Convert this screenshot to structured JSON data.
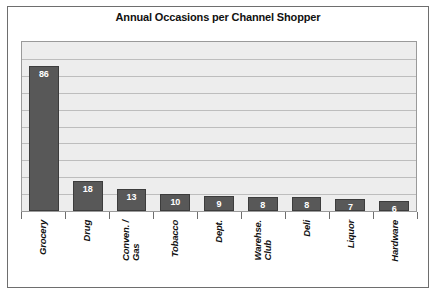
{
  "chart_data": {
    "type": "bar",
    "title": "Annual Occasions per Channel Shopper",
    "xlabel": "",
    "ylabel": "",
    "ylim": [
      0,
      100
    ],
    "grid": true,
    "gridline_count": 9,
    "legend": "none",
    "orientation": "vertical",
    "category_label_rotation": -90,
    "value_labels_inside_bars": true,
    "categories": [
      "Grocery",
      "Drug",
      "Conven. / Gas",
      "Tobacco",
      "Dept.",
      "Warehse. Club",
      "Deli",
      "Liquor",
      "Hardware"
    ],
    "category_lines": [
      [
        "Grocery"
      ],
      [
        "Drug"
      ],
      [
        "Conven. /",
        "Gas"
      ],
      [
        "Tobacco"
      ],
      [
        "Dept."
      ],
      [
        "Warehse.",
        "Club"
      ],
      [
        "Deli"
      ],
      [
        "Liquor"
      ],
      [
        "Hardware"
      ]
    ],
    "values": [
      86,
      18,
      13,
      10,
      9,
      8,
      8,
      7,
      6
    ],
    "value_labels": [
      "86",
      "18",
      "13",
      "10",
      "9",
      "8",
      "8",
      "7",
      "6"
    ]
  },
  "colors": {
    "bar_fill": "#585858",
    "bar_stroke": "#3c3c3c",
    "plot_background": "#ededed",
    "gridline": "#bdbdbd",
    "plot_border": "#9a9a9a",
    "frame_border": "#6e6e6e",
    "page_background": "#ffffff",
    "title_text": "#111111",
    "value_label_text": "#ffffff",
    "category_label_text": "#111111"
  }
}
